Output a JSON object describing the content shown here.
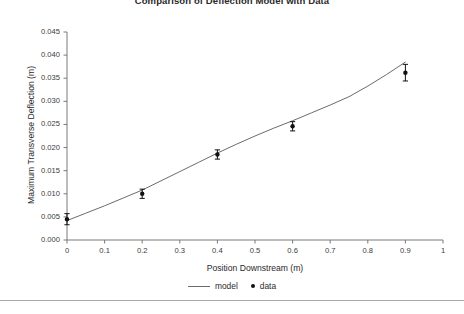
{
  "figure": {
    "bottom_rule": "horizontal-divider"
  },
  "legend": {
    "position": "bottom-center",
    "entries": [
      {
        "label": "model",
        "marker": "line",
        "color": "#6b6b6b"
      },
      {
        "label": "data",
        "marker": "dot",
        "color": "#111111"
      }
    ]
  },
  "chart_data": {
    "type": "scatter",
    "title": "Comparison of Deflection Model with Data",
    "xlabel": "Position Downstream (m)",
    "ylabel": "Maximum Transverse Deflection (m)",
    "xlim": [
      0,
      1
    ],
    "ylim": [
      0,
      0.045
    ],
    "xticks": [
      0,
      0.1,
      0.2,
      0.3,
      0.4,
      0.5,
      0.6,
      0.7,
      0.8,
      0.9,
      1
    ],
    "xtick_labels": [
      "0",
      "0.1",
      "0.2",
      "0.3",
      "0.4",
      "0.5",
      "0.6",
      "0.7",
      "0.8",
      "0.9",
      "1"
    ],
    "yticks": [
      0,
      0.005,
      0.01,
      0.015,
      0.02,
      0.025,
      0.03,
      0.035,
      0.04,
      0.045
    ],
    "ytick_labels": [
      "0.000",
      "0.005",
      "0.010",
      "0.015",
      "0.020",
      "0.025",
      "0.030",
      "0.035",
      "0.040",
      "0.045"
    ],
    "grid": false,
    "series": [
      {
        "name": "model",
        "type": "line",
        "color": "#6b6b6b",
        "x": [
          0.0,
          0.05,
          0.1,
          0.15,
          0.2,
          0.25,
          0.3,
          0.35,
          0.4,
          0.45,
          0.5,
          0.55,
          0.6,
          0.65,
          0.7,
          0.75,
          0.8,
          0.85,
          0.9
        ],
        "y": [
          0.0042,
          0.0058,
          0.0074,
          0.0091,
          0.0108,
          0.0128,
          0.0148,
          0.0168,
          0.0188,
          0.0207,
          0.0225,
          0.0242,
          0.0258,
          0.0275,
          0.0292,
          0.031,
          0.0333,
          0.0358,
          0.0385
        ]
      },
      {
        "name": "data",
        "type": "scatter",
        "color": "#111111",
        "x": [
          0.0,
          0.2,
          0.4,
          0.6,
          0.9
        ],
        "y": [
          0.0045,
          0.01,
          0.0185,
          0.0246,
          0.0362
        ],
        "yerr": [
          0.0012,
          0.001,
          0.001,
          0.001,
          0.0018
        ]
      }
    ]
  }
}
